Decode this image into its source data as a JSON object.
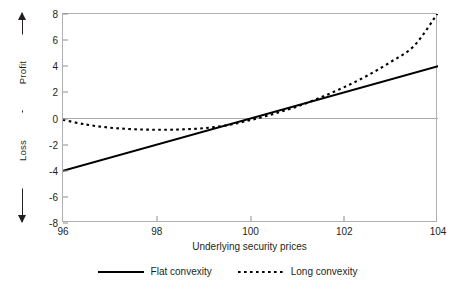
{
  "chart_data": {
    "type": "line",
    "title": "",
    "xlabel": "Underlying security prices",
    "ylabel": "",
    "xlim": [
      96,
      104
    ],
    "ylim": [
      -8,
      8
    ],
    "grid": false,
    "zero_line": true,
    "legend_position": "bottom-center",
    "xticks": [
      "96",
      "98",
      "100",
      "102",
      "104"
    ],
    "xtick_values": [
      96,
      98,
      100,
      102,
      104
    ],
    "yticks": [
      "8",
      "6",
      "4",
      "2",
      "0",
      "-2",
      "-4",
      "-6",
      "-8"
    ],
    "ytick_values": [
      8,
      6,
      4,
      2,
      0,
      -2,
      -4,
      -6,
      -8
    ],
    "x": [
      96,
      96.5,
      97,
      97.5,
      98,
      98.5,
      99,
      99.5,
      100,
      100.5,
      101,
      101.5,
      102,
      102.5,
      103,
      103.5,
      104
    ],
    "series": [
      {
        "name": "Flat convexity",
        "style": "solid",
        "color": "#000000",
        "values": [
          -4,
          -3.75,
          -3.5,
          -3.25,
          -3,
          -2.75,
          -2.5,
          -2.25,
          -2,
          -1.75,
          -1.5,
          -1.25,
          -1,
          -0.75,
          -0.5,
          -0.25,
          0
        ]
      },
      {
        "name": "Long convexity",
        "style": "dotted",
        "color": "#000000",
        "values": [
          -0.1,
          -0.45,
          -0.68,
          -0.8,
          -0.83,
          -0.78,
          -0.65,
          -0.43,
          -0.12,
          0.28,
          0.78,
          1.38,
          2.08,
          2.88,
          3.78,
          4.78,
          5.88
        ]
      }
    ],
    "series_plotted": [
      {
        "name": "Flat convexity",
        "note": "straight line from (96,-4) to (104,4)",
        "points": [
          [
            96,
            -4
          ],
          [
            104,
            4
          ]
        ]
      },
      {
        "name": "Long convexity",
        "note": "convex curve, minimum near x=98.3 at y=-0.85, crosses zero near x=100.1, rises to 8.1 at x=104",
        "points": [
          [
            96,
            -0.1
          ],
          [
            96.5,
            -0.47
          ],
          [
            97,
            -0.7
          ],
          [
            97.5,
            -0.82
          ],
          [
            98,
            -0.86
          ],
          [
            98.5,
            -0.84
          ],
          [
            99,
            -0.74
          ],
          [
            99.5,
            -0.52
          ],
          [
            100,
            -0.12
          ],
          [
            100.5,
            0.36
          ],
          [
            101,
            0.92
          ],
          [
            101.5,
            1.62
          ],
          [
            102,
            2.4
          ],
          [
            102.5,
            3.3
          ],
          [
            103,
            4.35
          ],
          [
            103.5,
            5.6
          ],
          [
            104,
            8.1
          ]
        ]
      }
    ],
    "annotations": {
      "y_axis_positive": "Profit",
      "y_axis_negative": "Loss",
      "y_axis_positive_arrow": "arrow-up",
      "y_axis_negative_arrow": "arrow-down"
    },
    "legend": [
      {
        "label": "Flat convexity",
        "style": "solid"
      },
      {
        "label": "Long convexity",
        "style": "dotted"
      }
    ]
  },
  "axes": {
    "y_profit_label": "Profit",
    "y_loss_label": "Loss",
    "x_title": "Underlying security prices",
    "yticks": [
      "8",
      "6",
      "4",
      "2",
      "0",
      "-2",
      "-4",
      "-6",
      "-8"
    ],
    "xticks": [
      "96",
      "98",
      "100",
      "102",
      "104"
    ]
  },
  "legend": {
    "flat": "Flat convexity",
    "long": "Long convexity"
  },
  "colors": {
    "line": "#000000",
    "frame": "#aeb0b3",
    "zero_line": "#a9abae",
    "text": "#231f20",
    "background": "#ffffff"
  }
}
